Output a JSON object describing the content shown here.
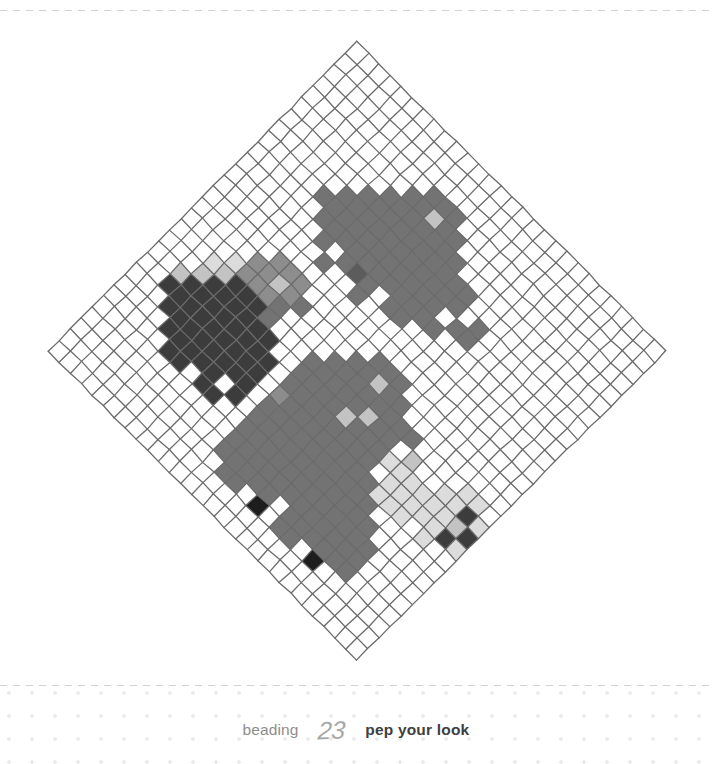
{
  "page": {
    "background_color": "#ffffff",
    "width": 712,
    "height": 764
  },
  "footer": {
    "craft_label": "beading",
    "page_number": "23",
    "tagline": "pep your look",
    "craft_color": "#8d8d8d",
    "number_color": "#a8a8a8",
    "tagline_color": "#404040",
    "dot_color": "#ececec",
    "rule_color": "#c9c9c9"
  },
  "artwork": {
    "title": "beaded pixel chart",
    "grid_type": "diamond-rotated-square-grid",
    "rotation_degrees": 45,
    "columns": 28,
    "rows": 28,
    "cell_size_px": 15.6,
    "center_x": 357,
    "center_y": 351,
    "grid_line_color": "#6a6a6a",
    "grid_line_width": 1.3,
    "palette": {
      "empty": "#ffffff",
      "black": "#1d1d1d",
      "darkest": "#3c3c3c",
      "dark": "#5c5c5c",
      "medium": "#737373",
      "medium_light": "#8d8d8d",
      "light": "#c3c3c3",
      "lightest": "#dcdcdc"
    },
    "legend": [
      {
        "key": "k",
        "name": "black bead",
        "color": "#1d1d1d"
      },
      {
        "key": "d",
        "name": "charcoal bead",
        "color": "#3c3c3c"
      },
      {
        "key": "m",
        "name": "dark grey bead",
        "color": "#5c5c5c"
      },
      {
        "key": "g",
        "name": "grey bead",
        "color": "#737373"
      },
      {
        "key": "s",
        "name": "mid grey bead",
        "color": "#8d8d8d"
      },
      {
        "key": "l",
        "name": "light grey bead",
        "color": "#c3c3c3"
      },
      {
        "key": "w",
        "name": "pale grey bead",
        "color": "#dcdcdc"
      },
      {
        "key": ".",
        "name": "empty",
        "color": "#ffffff"
      }
    ],
    "pattern_rows": [
      "............................",
      "............................",
      "............................",
      "..........ggg...............",
      ".........gglgg..............",
      "........ggggggg.............",
      ".......gggggggggg...........",
      "......ggggggggggg.g.........",
      ".....ggggggggggg.gg.........",
      "......ggggggggggg...........",
      ".......g.gmg.gg.............",
      "........g..g................",
      "............................",
      "......sss......ggg..........",
      ".....sslsg....gglgg.........",
      "....wsssg....gggggggg....ww.",
      "...wldddg...ggggglgg.l..wwdw",
      "...ldddddd..gggglgggwwwwwwld",
      "..ldddddddd.gggggggg.wwwwwdw",
      "..ddddddddd.sggggggggwww.w..",
      "...dddddddd.gggggggggg......",
      "....ddddd.d.ggggggggggg.....",
      ".....dd.dd..gggggggggggg....",
      "............gggggggggggg....",
      "............ggggg.gggggg....",
      ".............gg.k.gg.k......",
      "............................",
      "............................"
    ]
  }
}
